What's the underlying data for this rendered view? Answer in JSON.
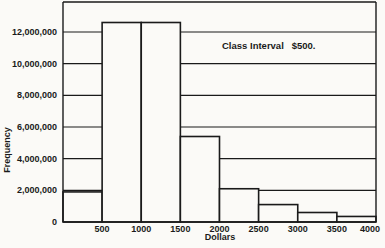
{
  "chart_data": {
    "type": "bar",
    "subtype": "histogram",
    "title": "",
    "annotation": "Class Interval   $500.",
    "xlabel": "Dollars",
    "ylabel": "Frequency",
    "x_ticks": [
      "500",
      "1000",
      "1500",
      "2000",
      "2500",
      "3000",
      "3500",
      "4000"
    ],
    "y_ticks": [
      "0",
      "2,000,000",
      "4,000,000",
      "6,000,000",
      "8,000,000",
      "10,000,000",
      "12,000,000"
    ],
    "xlim": [
      0,
      4000
    ],
    "ylim": [
      0,
      13000000
    ],
    "grid": "horizontal lines at each y tick",
    "bin_edges": [
      0,
      500,
      1000,
      1500,
      2000,
      2500,
      3000,
      3500,
      4000
    ],
    "categories": [
      "0-500",
      "500-1000",
      "1000-1500",
      "1500-2000",
      "2000-2500",
      "2500-3000",
      "3000-3500",
      "3500-4000"
    ],
    "values": [
      1900000,
      12600000,
      12600000,
      5400000,
      2100000,
      1100000,
      600000,
      350000
    ],
    "legend": []
  },
  "labels": {
    "annotation": "Class Interval   $500.",
    "xlabel": "Dollars",
    "ylabel": "Frequency"
  },
  "colors": {
    "ink": "#1a1a1a",
    "paper": "#fbfaf7"
  }
}
